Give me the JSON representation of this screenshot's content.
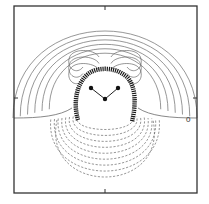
{
  "figure": {
    "title": "",
    "zero_contour_label": "0",
    "molecule": {
      "atoms": [
        {
          "element": "H",
          "name": "hydrogen-left"
        },
        {
          "element": "H",
          "name": "hydrogen-right"
        },
        {
          "element": "O",
          "name": "oxygen"
        }
      ],
      "bonds": [
        [
          "hydrogen-left",
          "oxygen"
        ],
        [
          "hydrogen-right",
          "oxygen"
        ]
      ]
    },
    "contours": {
      "positive": {
        "style": "solid",
        "count": 9
      },
      "zero": {
        "style": "solid",
        "label": "0"
      },
      "negative": {
        "style": "dashed",
        "count": 9
      }
    },
    "colors": {
      "frame": "#333333",
      "contour": "#6a6a6a",
      "atom": "#111111",
      "background": "#ffffff"
    }
  }
}
